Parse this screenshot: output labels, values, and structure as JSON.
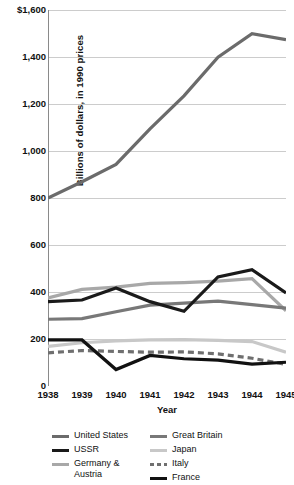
{
  "chart_data": {
    "type": "line",
    "title": "",
    "xlabel": "Year",
    "ylabel": "Billions of dollars, in 1990 prices",
    "x": [
      1938,
      1939,
      1940,
      1941,
      1942,
      1943,
      1944,
      1945
    ],
    "xticklabels": [
      "1938",
      "1939",
      "1940",
      "1941",
      "1942",
      "1943",
      "1944",
      "1945"
    ],
    "yticklabels": [
      "$1,600",
      "1,400",
      "1,200",
      "1,000",
      "800",
      "600",
      "400",
      "200",
      "0"
    ],
    "yticks": [
      1600,
      1400,
      1200,
      1000,
      800,
      600,
      400,
      200,
      0
    ],
    "ylim": [
      0,
      1600
    ],
    "xlim": [
      1938,
      1945
    ],
    "grid": "horizontal",
    "legend_position": "bottom",
    "series": [
      {
        "name": "United States",
        "color": "#6b6b6b",
        "style": "solid",
        "width": 3.2,
        "values": [
          800,
          869,
          943,
          1094,
          1235,
          1399,
          1499,
          1474
        ]
      },
      {
        "name": "USSR",
        "color": "#1a1a1a",
        "style": "solid",
        "width": 3.2,
        "values": [
          359,
          366,
          417,
          359,
          318,
          464,
          495,
          396
        ]
      },
      {
        "name": "Germany & Austria",
        "color": "#a8a8a8",
        "style": "solid",
        "width": 3.2,
        "values": [
          375,
          411,
          421,
          437,
          440,
          446,
          457,
          320
        ]
      },
      {
        "name": "Great Britain",
        "color": "#787878",
        "style": "solid",
        "width": 3.2,
        "values": [
          284,
          287,
          316,
          344,
          353,
          361,
          346,
          331
        ]
      },
      {
        "name": "Japan",
        "color": "#c8c8c8",
        "style": "solid",
        "width": 3.2,
        "values": [
          169,
          184,
          192,
          196,
          197,
          194,
          189,
          144
        ]
      },
      {
        "name": "Italy",
        "color": "#6f6f6f",
        "style": "dashed",
        "width": 3.2,
        "values": [
          141,
          151,
          147,
          144,
          145,
          137,
          118,
          92
        ]
      },
      {
        "name": "France",
        "color": "#111111",
        "style": "solid",
        "width": 3.2,
        "values": [
          196,
          196,
          70,
          130,
          116,
          110,
          93,
          101
        ]
      }
    ]
  },
  "yaxis": {
    "title": "Billions of dollars, in 1990 prices",
    "ticks": [
      {
        "label": "$1,600",
        "value": 1600
      },
      {
        "label": "1,400",
        "value": 1400
      },
      {
        "label": "1,200",
        "value": 1200
      },
      {
        "label": "1,000",
        "value": 1000
      },
      {
        "label": "800",
        "value": 800
      },
      {
        "label": "600",
        "value": 600
      },
      {
        "label": "400",
        "value": 400
      },
      {
        "label": "200",
        "value": 200
      },
      {
        "label": "0",
        "value": 0
      }
    ]
  },
  "xaxis": {
    "title": "Year",
    "ticks": [
      {
        "label": "1938",
        "value": 1938
      },
      {
        "label": "1939",
        "value": 1939
      },
      {
        "label": "1940",
        "value": 1940
      },
      {
        "label": "1941",
        "value": 1941
      },
      {
        "label": "1942",
        "value": 1942
      },
      {
        "label": "1943",
        "value": 1943
      },
      {
        "label": "1944",
        "value": 1944
      },
      {
        "label": "1945",
        "value": 1945
      }
    ]
  },
  "legend": {
    "columns": [
      {
        "items": [
          {
            "label": "United States",
            "color": "#6b6b6b",
            "style": "solid"
          },
          {
            "label": "USSR",
            "color": "#1a1a1a",
            "style": "solid"
          },
          {
            "label": "Germany &\nAustria",
            "color": "#a8a8a8",
            "style": "solid"
          }
        ]
      },
      {
        "items": [
          {
            "label": "Great Britain",
            "color": "#787878",
            "style": "solid"
          },
          {
            "label": "Japan",
            "color": "#c8c8c8",
            "style": "solid"
          },
          {
            "label": "Italy",
            "color": "#6f6f6f",
            "style": "dashed"
          },
          {
            "label": "France",
            "color": "#111111",
            "style": "solid"
          }
        ]
      }
    ]
  },
  "colors": {
    "grid": "#cccccc",
    "axis": "#8a8a8a",
    "background": "#ffffff",
    "text": "#111111"
  }
}
